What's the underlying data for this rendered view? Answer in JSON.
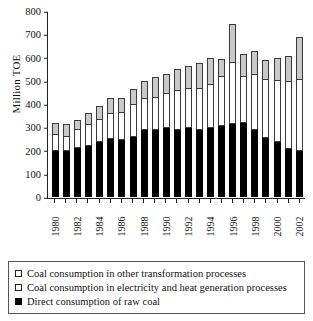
{
  "chart_data": {
    "type": "bar",
    "subtype": "stacked",
    "title": "",
    "xlabel": "",
    "ylabel": "Million TOE",
    "ylim": [
      0,
      800
    ],
    "ytick_step": 100,
    "yticks": [
      0,
      100,
      200,
      300,
      400,
      500,
      600,
      700,
      800
    ],
    "grid": false,
    "legend_position": "below",
    "categories": [
      1980,
      1981,
      1982,
      1983,
      1984,
      1985,
      1986,
      1987,
      1988,
      1989,
      1990,
      1991,
      1992,
      1993,
      1994,
      1995,
      1996,
      1997,
      1998,
      1999,
      2000,
      2001,
      2002
    ],
    "xtick_labels": [
      "1980",
      "",
      "1982",
      "",
      "1984",
      "",
      "1986",
      "",
      "1988",
      "",
      "1990",
      "",
      "1992",
      "",
      "1994",
      "",
      "1996",
      "",
      "1998",
      "",
      "2000",
      "",
      "2002"
    ],
    "series": [
      {
        "name": "Direct consumption of raw coal",
        "color": "#000000",
        "values": [
          200,
          200,
          210,
          220,
          235,
          250,
          245,
          260,
          290,
          290,
          295,
          290,
          295,
          290,
          295,
          305,
          315,
          320,
          290,
          255,
          235,
          205,
          200
        ]
      },
      {
        "name": "Coal consumption in electricity and heat generation processes",
        "color": "#ffffff",
        "values": [
          65,
          60,
          80,
          90,
          95,
          105,
          115,
          135,
          130,
          135,
          150,
          165,
          170,
          175,
          185,
          210,
          260,
          195,
          235,
          250,
          265,
          290,
          305
        ]
      },
      {
        "name": "Coal consumption in other transformation processes",
        "color": "#c9c9c9",
        "values": [
          55,
          55,
          40,
          50,
          60,
          70,
          65,
          70,
          80,
          90,
          85,
          95,
          100,
          110,
          120,
          80,
          170,
          100,
          105,
          85,
          100,
          110,
          185
        ]
      }
    ],
    "totals": [
      320,
      315,
      330,
      360,
      390,
      425,
      425,
      465,
      500,
      515,
      530,
      550,
      565,
      575,
      600,
      595,
      745,
      615,
      630,
      590,
      600,
      605,
      690
    ]
  },
  "legend": {
    "items": [
      {
        "label": "Coal consumption in other transformation processes",
        "swatch": "gray"
      },
      {
        "label": "Coal consumption in electricity and heat generation processes",
        "swatch": "white"
      },
      {
        "label": "Direct consumption of raw coal",
        "swatch": "black"
      }
    ]
  }
}
